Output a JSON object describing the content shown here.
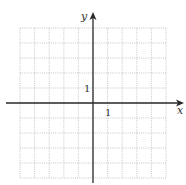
{
  "figure": {
    "type": "coordinate-grid",
    "x_axis_label": "x",
    "y_axis_label": "y",
    "x_tick_label": "1",
    "y_tick_label": "1",
    "grid": {
      "columns": 10,
      "rows": 10,
      "x_range": [
        -5,
        5
      ],
      "y_range": [
        -5,
        5
      ],
      "line_style": "dotted",
      "line_color": "#b8b8b8"
    },
    "axis_color": "#2a2a2a"
  }
}
